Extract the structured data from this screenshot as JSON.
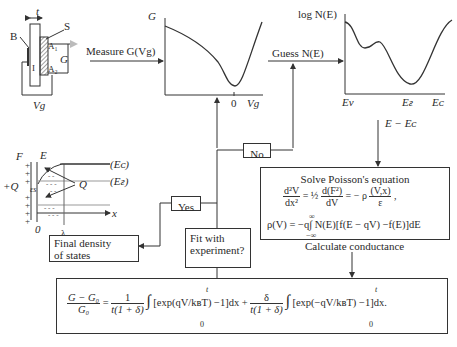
{
  "device_sketch": {
    "labels": {
      "t": "t",
      "S": "S",
      "B": "B",
      "A1": "A₁",
      "A2": "A₂",
      "I": "I",
      "G": "G",
      "Vg": "Vg"
    }
  },
  "band_sketch": {
    "labels": {
      "F": "F",
      "E": "E",
      "plusQ": "+Q",
      "Q": "Q",
      "EC": "(Eᴄ)",
      "EF": "(Eғ)",
      "x": "x",
      "zero": "0",
      "lambda": "λ",
      "epsilon": "εs"
    }
  },
  "g_plot": {
    "ylabel": "G",
    "xlabel": "Vg",
    "x_tick": "0",
    "input_label": "Measure G(Vg)"
  },
  "n_plot": {
    "ylabel": "log N(E)",
    "x_ticks": [
      "Eᴠ",
      "Eғ",
      "Eᴄ"
    ],
    "input_label": "Guess N(E)",
    "axis_note": "E − Eᴄ"
  },
  "flow": {
    "no_label": "No",
    "yes_label": "Yes",
    "fit_box": [
      "Fit with",
      "experiment?"
    ],
    "final_box": [
      "Final density",
      "of states"
    ],
    "poisson_title": "Solve Poisson's equation",
    "poisson_eq1": "d²V/dx² = ½ d(F²)/dV = −ρ(V,x)/ε,",
    "poisson_eq2": "ρ(V) = −q ∫ N(E)[f(E − qV) − f(E)]dE",
    "calc_label": "Calculate conductance",
    "conductance_eq": "(G − G₀)/G₀ = 1/(t(1+δ)) ∫₀ᵗ [exp(qV/kʙT) − 1]dx + δ/(t(1+δ)) ∫₀ᵗ [exp(−qV/kʙT) − 1]dx."
  },
  "eq_parts": {
    "lhs_num": "G − G₀",
    "lhs_den": "G₀",
    "f1_num": "1",
    "f1_den": "t(1 + δ)",
    "term1": "[exp(qV/kʙT) −1]dx +",
    "f2_num": "δ",
    "f2_den": "t(1 + δ)",
    "term2": "[exp(−qV/kʙT) −1]dx.",
    "int_lo": "0",
    "int_hi": "t",
    "p_num1": "d²V",
    "p_den1": "dx²",
    "p_half": "= ½",
    "p_num2": "d(F²)",
    "p_den2": "dV",
    "p_mid": "= − ρ",
    "p_num3": "(V,x)",
    "p_den3": "ε",
    "p_end": ",",
    "rho_line": "ρ(V) = −q∫ N(E)[f(E − qV) −f(E)]dE",
    "rho_hi": "∞",
    "rho_lo": "−∞"
  }
}
